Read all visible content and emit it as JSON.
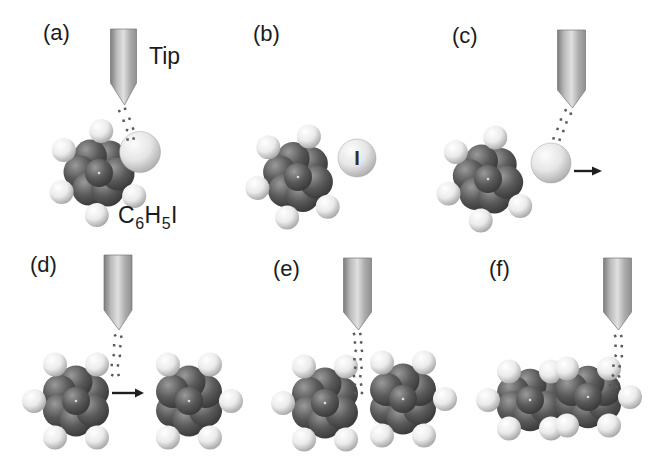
{
  "figure": {
    "background": "#ffffff",
    "panels": [
      {
        "id": "a",
        "label": "(a)"
      },
      {
        "id": "b",
        "label": "(b)"
      },
      {
        "id": "c",
        "label": "(c)"
      },
      {
        "id": "d",
        "label": "(d)"
      },
      {
        "id": "e",
        "label": "(e)"
      },
      {
        "id": "f",
        "label": "(f)"
      }
    ],
    "annotations": {
      "tip_label": "Tip",
      "iodine_label": "I",
      "formula": {
        "c": "C",
        "c_sub": "6",
        "h": "H",
        "h_sub": "5",
        "i": "I"
      }
    },
    "colors": {
      "text": "#1b1b1b",
      "arrow": "#1f1f1f",
      "dots": "#5a5a5a",
      "tip_outline": "#757575"
    },
    "materials": {
      "carbon": [
        "#9a9a9a",
        "#5a5a5a",
        "#323232"
      ],
      "hydrogen": [
        "#ffffff",
        "#ebebeb",
        "#989898"
      ],
      "iodine": [
        "#fcfcfc",
        "#e6e6e6",
        "#a3a3a3"
      ],
      "tip": [
        "#7d7d7d",
        "#bcbcbc",
        "#e0e0e0",
        "#adadad",
        "#8f8f8f"
      ]
    }
  }
}
